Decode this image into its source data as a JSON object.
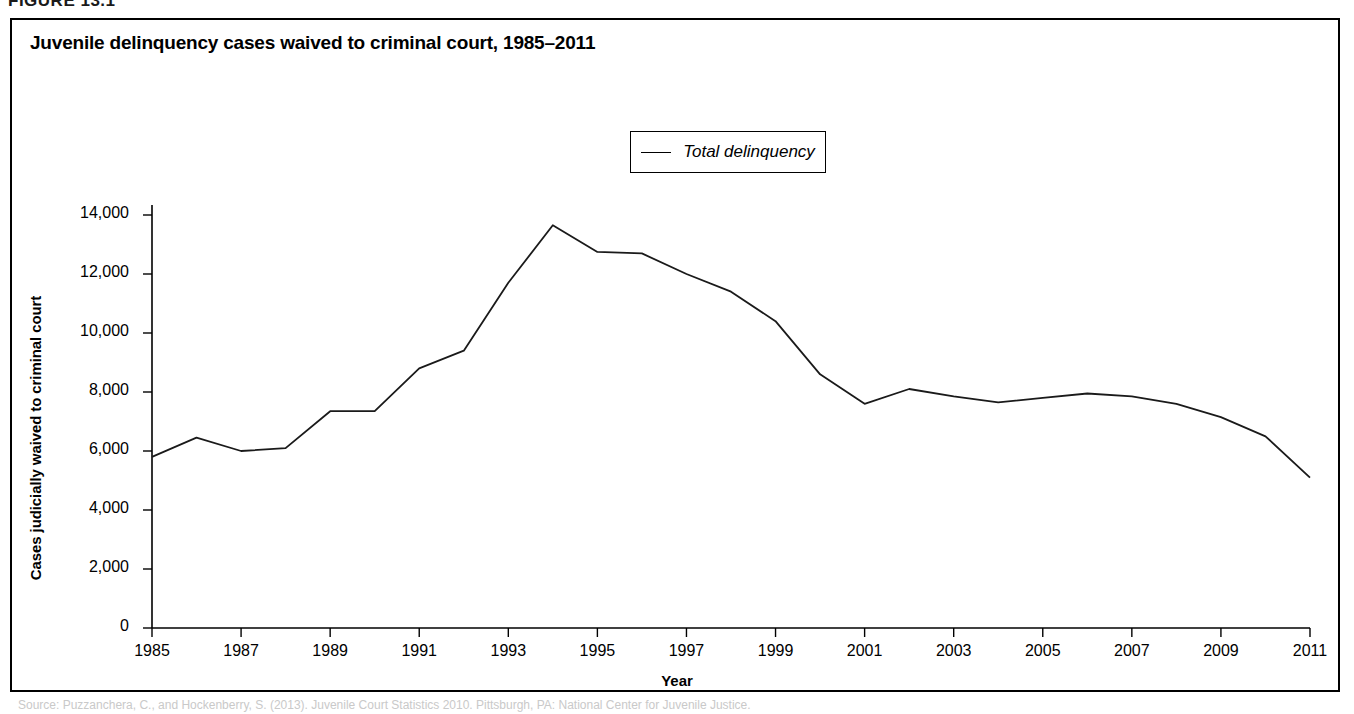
{
  "figure": {
    "label": "FIGURE 13.1",
    "bottom_caption": "Source: Puzzanchera, C., and Hockenberry, S. (2013). Juvenile Court Statistics 2010. Pittsburgh, PA: National Center for Juvenile Justice."
  },
  "chart_data": {
    "type": "line",
    "title": "Juvenile delinquency cases waived to criminal court, 1985–2011",
    "xlabel": "Year",
    "ylabel": "Cases judicially waived to criminal court",
    "grid": false,
    "legend_position": "top-center",
    "xlim": [
      1985,
      2011
    ],
    "ylim": [
      0,
      14000
    ],
    "xticks": [
      1985,
      1987,
      1989,
      1991,
      1993,
      1995,
      1997,
      1999,
      2001,
      2003,
      2005,
      2007,
      2009,
      2011
    ],
    "xtick_labels": [
      "1985",
      "1987",
      "1989",
      "1991",
      "1993",
      "1995",
      "1997",
      "1999",
      "2001",
      "2003",
      "2005",
      "2007",
      "2009",
      "2011"
    ],
    "yticks": [
      0,
      2000,
      4000,
      6000,
      8000,
      10000,
      12000,
      14000
    ],
    "ytick_labels": [
      "0",
      "2,000",
      "4,000",
      "6,000",
      "8,000",
      "10,000",
      "12,000",
      "14,000"
    ],
    "x": [
      1985,
      1986,
      1987,
      1988,
      1989,
      1990,
      1991,
      1992,
      1993,
      1994,
      1995,
      1996,
      1997,
      1998,
      1999,
      2000,
      2001,
      2002,
      2003,
      2004,
      2005,
      2006,
      2007,
      2008,
      2009,
      2010,
      2011
    ],
    "series": [
      {
        "name": "Total delinquency",
        "color": "#1a1a1a",
        "values": [
          5800,
          6450,
          6000,
          6100,
          7350,
          7350,
          8800,
          9400,
          11700,
          13650,
          12750,
          12700,
          12000,
          11400,
          10400,
          8600,
          7600,
          8100,
          7850,
          7650,
          7800,
          7950,
          7850,
          7600,
          7150,
          6500,
          5100
        ]
      }
    ]
  }
}
